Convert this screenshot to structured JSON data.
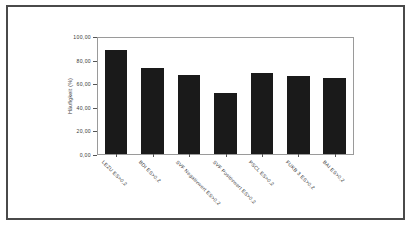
{
  "chart_data": {
    "type": "bar",
    "title": "",
    "subtitle": "",
    "xlabel": "",
    "ylabel": "Häufigkeit (%)",
    "ylim": [
      0,
      100
    ],
    "grid": false,
    "legend": null,
    "categories": [
      "LEZU ES>0,2",
      "BDI ES>0,2",
      "SVF Negativwert ES>0,2",
      "SVF Positivwert ES>0,2",
      "PSCL ES>0,2",
      "FUKB 3 ES>0,2",
      "BAI ES>0,2"
    ],
    "values": [
      89.6,
      73.9,
      67.8,
      53.0,
      69.6,
      67.0,
      65.2
    ],
    "y_ticks": [
      0,
      20,
      40,
      60,
      80,
      100
    ],
    "y_tick_labels": [
      "0,00",
      "20,00",
      "40,00",
      "60,00",
      "80,00",
      "100,00"
    ],
    "bar_color": "#1a1a1a",
    "panel_border_color": "#9a9a9a",
    "frame_color": "#4a4a4a",
    "background_color": "#ffffff"
  }
}
